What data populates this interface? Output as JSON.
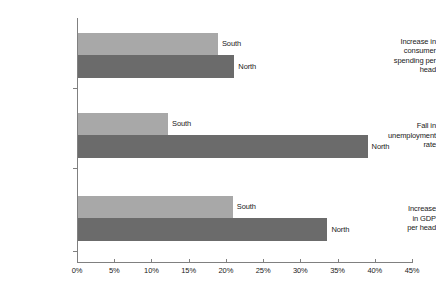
{
  "chart_data": {
    "type": "bar",
    "orientation": "horizontal",
    "title": "",
    "subtitle": "",
    "xlabel": "",
    "ylabel": "",
    "xlim": [
      0,
      45
    ],
    "xtick_step": 5,
    "grid": false,
    "legend": "inline-bar-labels",
    "categories": [
      "Increase in consumer spending per head",
      "Fall in unemployment rate",
      "Increase in GDP per head"
    ],
    "category_lines": [
      [
        "Increase in",
        "consumer",
        "spending per",
        "head"
      ],
      [
        "Fall in",
        "unemployment",
        "rate"
      ],
      [
        "Increase",
        "in GDP",
        "per head"
      ]
    ],
    "series": [
      {
        "name": "South",
        "color": "#a8a8a8",
        "values": [
          18.8,
          12.1,
          20.8
        ]
      },
      {
        "name": "North",
        "color": "#6b6b6b",
        "values": [
          21.0,
          38.9,
          33.5
        ]
      }
    ],
    "xticks": [
      {
        "value": 0,
        "label": "0%"
      },
      {
        "value": 5,
        "label": "5%"
      },
      {
        "value": 10,
        "label": "10%"
      },
      {
        "value": 15,
        "label": "15%"
      },
      {
        "value": 20,
        "label": "20%"
      },
      {
        "value": 25,
        "label": "25%"
      },
      {
        "value": 30,
        "label": "30%"
      },
      {
        "value": 35,
        "label": "35%"
      },
      {
        "value": 40,
        "label": "40%"
      },
      {
        "value": 45,
        "label": "45%"
      }
    ],
    "axis_color": "#808080",
    "text_color": "#1a1a1a",
    "background": "#ffffff"
  },
  "layout": {
    "axis_x0_px": 77,
    "axis_x45_px": 412,
    "px_per_percent": 7.4444,
    "axis_top_px": 18,
    "axis_bottom_px": 262,
    "group_tops_px": [
      33,
      113,
      196
    ],
    "bar_height_px": 22,
    "bar_height_north_px": 23
  }
}
